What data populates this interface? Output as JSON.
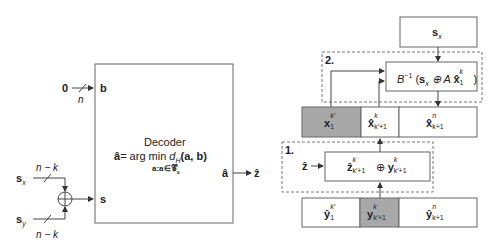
{
  "colors": {
    "stroke": "#555555",
    "shaded_cell": "#a8a8a8",
    "dashed": "#666666"
  },
  "left": {
    "input_b": {
      "value": "0",
      "width_label": "n",
      "port": "b"
    },
    "input_sx": {
      "label": "s",
      "sub": "x",
      "width_label": "n − k"
    },
    "input_sy": {
      "label": "s",
      "sub": "y",
      "width_label": "n − k"
    },
    "xor_symbol": "⊕",
    "port_s": "s",
    "decoder": {
      "title": "Decoder",
      "eq_lhs": "â",
      "eq_rhs": "= arg min ",
      "eq_d": "d",
      "eq_d_sub": "H",
      "eq_args": "(a, b)",
      "constraint": "a:a∈𝒞",
      "constraint_sub": "s"
    },
    "output_port": "â",
    "output_label": "ẑ"
  },
  "right": {
    "top_box": {
      "label": "s",
      "sub": "x"
    },
    "step2": {
      "number": "2.",
      "formula_B": "B",
      "formula_inv": "−1",
      "formula_open": " (",
      "formula_s": "s",
      "formula_s_sub": "x",
      "formula_op": " ⊕ A ",
      "formula_x": "x̂",
      "formula_x_sub": "1",
      "formula_x_sup": "k",
      "formula_close": ")"
    },
    "x_row": [
      {
        "base": "x",
        "sup": "k′",
        "sub": "1",
        "shaded": true
      },
      {
        "base": "x̂",
        "sup": "k",
        "sub": "k′+1",
        "shaded": false
      },
      {
        "base": "x̂",
        "sup": "n",
        "sub": "k+1",
        "shaded": false
      }
    ],
    "step1": {
      "number": "1.",
      "input": "ẑ",
      "formula_z": "ẑ",
      "formula_z_sup": "k",
      "formula_z_sub": "k′+1",
      "formula_op": " ⊕ ",
      "formula_y": "y",
      "formula_y_sup": "k",
      "formula_y_sub": "k′+1"
    },
    "y_row": [
      {
        "base": "ŷ",
        "sup": "k′",
        "sub": "1",
        "shaded": false
      },
      {
        "base": "y",
        "sup": "k",
        "sub": "k′+1",
        "shaded": true
      },
      {
        "base": "ŷ",
        "sup": "n",
        "sub": "k+1",
        "shaded": false
      }
    ]
  }
}
